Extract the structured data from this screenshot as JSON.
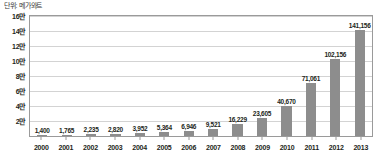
{
  "chart_data": {
    "type": "bar",
    "title": "",
    "subtitle": "",
    "unit_caption": "단위: 메가와트",
    "xlabel": "",
    "ylabel": "",
    "ylim": [
      0,
      160000
    ],
    "grid": true,
    "legend": false,
    "legend_position": "none",
    "bar_color": "#8d8d8d",
    "categories": [
      "2000",
      "2001",
      "2002",
      "2003",
      "2004",
      "2005",
      "2006",
      "2007",
      "2008",
      "2009",
      "2010",
      "2011",
      "2012",
      "2013"
    ],
    "values": [
      1400,
      1765,
      2235,
      2820,
      3952,
      5364,
      6946,
      9521,
      16229,
      23605,
      40670,
      71061,
      102156,
      141156
    ],
    "data_labels": [
      "1,400",
      "1,765",
      "2,235",
      "2,820",
      "3,952",
      "5,364",
      "6,946",
      "9,521",
      "16,229",
      "23,605",
      "40,670",
      "71,061",
      "102,156",
      "141,156"
    ],
    "y_ticks": [
      {
        "value": 160000,
        "label": "16만"
      },
      {
        "value": 140000,
        "label": "14만"
      },
      {
        "value": 120000,
        "label": "12만"
      },
      {
        "value": 100000,
        "label": "10만"
      },
      {
        "value": 80000,
        "label": "8만"
      },
      {
        "value": 60000,
        "label": "6만"
      },
      {
        "value": 40000,
        "label": "4만"
      },
      {
        "value": 20000,
        "label": "2만"
      }
    ]
  }
}
